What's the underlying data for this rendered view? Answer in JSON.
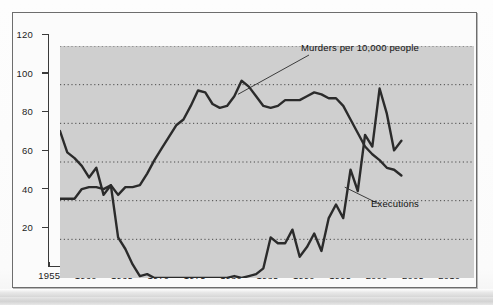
{
  "figure": {
    "background_color": "#fbfbfb",
    "plot_background_color": "#cfcfcf",
    "frame_color": "#6d6d6d",
    "line_color": "#2b2b2b"
  },
  "chart_data": {
    "type": "line",
    "title": "",
    "subtitle": "",
    "xlabel": "",
    "ylabel": "",
    "xlim": [
      1955,
      2012
    ],
    "ylim": [
      0,
      120
    ],
    "xticks": [
      1955,
      1960,
      1965,
      1970,
      1975,
      1980,
      1985,
      1990,
      1995,
      2000,
      2005,
      2010
    ],
    "yticks": [
      20,
      40,
      60,
      80,
      100,
      120
    ],
    "grid": "horizontal-dotted",
    "legend": "inline-annotations",
    "annotations": [
      {
        "text": "Murders per 10,000 people",
        "x": 1989,
        "y": 112
      },
      {
        "text": "Executions",
        "x": 1998,
        "y": 31
      }
    ],
    "series": [
      {
        "name": "Murders per 10,000 people",
        "x": [
          1955,
          1956,
          1957,
          1958,
          1959,
          1960,
          1961,
          1962,
          1963,
          1964,
          1965,
          1966,
          1967,
          1968,
          1969,
          1970,
          1971,
          1972,
          1973,
          1974,
          1975,
          1976,
          1977,
          1978,
          1979,
          1980,
          1981,
          1982,
          1983,
          1984,
          1985,
          1986,
          1987,
          1988,
          1989,
          1990,
          1991,
          1992,
          1993,
          1994,
          1995,
          1996,
          1997,
          1998,
          1999,
          2000,
          2001,
          2002
        ],
        "values": [
          41,
          41,
          41,
          46,
          47,
          47,
          46,
          48,
          43,
          47,
          47,
          48,
          54,
          61,
          67,
          73,
          79,
          82,
          89,
          97,
          96,
          90,
          88,
          89,
          94,
          102,
          99,
          94,
          89,
          88,
          89,
          92,
          92,
          92,
          94,
          96,
          95,
          93,
          93,
          89,
          82,
          75,
          68,
          64,
          61,
          57,
          56,
          53
        ]
      },
      {
        "name": "Executions",
        "x": [
          1955,
          1956,
          1957,
          1958,
          1959,
          1960,
          1961,
          1962,
          1963,
          1964,
          1965,
          1966,
          1967,
          1968,
          1969,
          1970,
          1971,
          1972,
          1973,
          1974,
          1975,
          1976,
          1977,
          1978,
          1979,
          1980,
          1981,
          1982,
          1983,
          1984,
          1985,
          1986,
          1987,
          1988,
          1989,
          1990,
          1991,
          1992,
          1993,
          1994,
          1995,
          1996,
          1997,
          1998,
          1999,
          2000,
          2001,
          2002
        ],
        "values": [
          76,
          65,
          62,
          58,
          52,
          57,
          43,
          48,
          21,
          15,
          7,
          1,
          2,
          0,
          0,
          0,
          0,
          0,
          0,
          0,
          0,
          0,
          0,
          0,
          1,
          0,
          1,
          2,
          5,
          21,
          18,
          18,
          25,
          11,
          16,
          23,
          14,
          31,
          38,
          31,
          56,
          45,
          74,
          68,
          98,
          85,
          66,
          71
        ]
      }
    ]
  },
  "axis": {
    "y_labels": [
      "120",
      "100",
      "80",
      "60",
      "40",
      "20"
    ],
    "x_labels": [
      "1955",
      "1960",
      "1965",
      "1970",
      "1975",
      "1980",
      "1985",
      "1990",
      "1995",
      "2000",
      "2005",
      "2010"
    ]
  },
  "labels": {
    "murders": "Murders per 10,000 people",
    "executions": "Executions"
  }
}
